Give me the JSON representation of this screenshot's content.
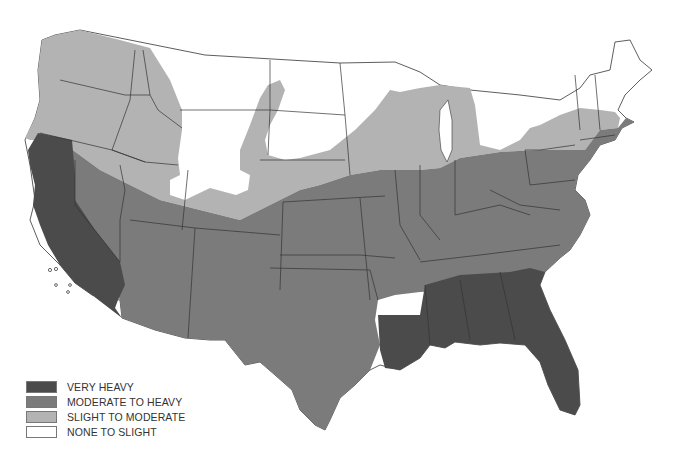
{
  "map": {
    "subject": "Contiguous United States zone map",
    "colors": {
      "very_heavy": "#4b4b4b",
      "moderate_to_heavy": "#7b7b7b",
      "slight_to_moderate": "#b3b3b3",
      "none_to_slight": "#ffffff",
      "border": "#333333"
    },
    "zones": {
      "very_heavy": [
        "California",
        "Louisiana",
        "Mississippi",
        "Alabama",
        "Georgia",
        "South Carolina",
        "Florida"
      ],
      "moderate_to_heavy": [
        "Nevada",
        "Utah",
        "Colorado",
        "Arizona",
        "New Mexico",
        "Texas",
        "Oklahoma",
        "Kansas",
        "Nebraska",
        "Iowa",
        "Missouri",
        "Arkansas",
        "Illinois",
        "Indiana",
        "Ohio",
        "Kentucky",
        "Tennessee",
        "West Virginia",
        "Virginia",
        "North Carolina",
        "Pennsylvania",
        "New York",
        "New Jersey",
        "Delaware",
        "Maryland",
        "Connecticut",
        "Rhode Island",
        "Massachusetts"
      ],
      "slight_to_moderate": [
        "Washington",
        "Oregon",
        "Idaho",
        "western Montana",
        "Wyoming",
        "Wisconsin",
        "Michigan",
        "southern Minnesota",
        "southern South Dakota",
        "northern Nevada/Utah"
      ],
      "none_to_slight": [
        "Montana",
        "North Dakota",
        "South Dakota",
        "Minnesota",
        "Maine",
        "New Hampshire",
        "Vermont",
        "northern New York"
      ]
    }
  },
  "legend": {
    "items": [
      {
        "label": "VERY HEAVY",
        "color": "#4b4b4b"
      },
      {
        "label": "MODERATE TO HEAVY",
        "color": "#7b7b7b"
      },
      {
        "label": "SLIGHT TO MODERATE",
        "color": "#b3b3b3"
      },
      {
        "label": "NONE TO SLIGHT",
        "color": "#ffffff"
      }
    ]
  }
}
